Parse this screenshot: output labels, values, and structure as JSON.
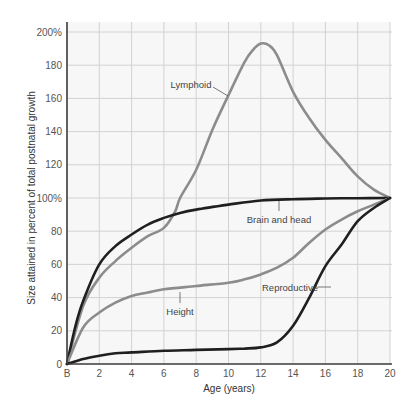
{
  "chart_data": {
    "type": "line",
    "title": "",
    "xlabel": "Age (years)",
    "ylabel": "Size attained in percent of total postnatal growth",
    "xlim": [
      0,
      20
    ],
    "ylim": [
      0,
      200
    ],
    "grid": true,
    "legend": "inline labels",
    "x_tick_labels": [
      "B",
      "2",
      "4",
      "6",
      "8",
      "10",
      "12",
      "14",
      "16",
      "18",
      "20"
    ],
    "y_tick_labels": [
      "0",
      "20",
      "40",
      "60",
      "80",
      "100%",
      "120",
      "140",
      "160",
      "180",
      "200%"
    ],
    "series": [
      {
        "name": "Lymphoid",
        "color": "#8c8c8c",
        "x": [
          0,
          1,
          2,
          3,
          4,
          5,
          6,
          6.7,
          7,
          8,
          9,
          10,
          11,
          11.5,
          12,
          12.5,
          13,
          14,
          15,
          16,
          17,
          18,
          19,
          20
        ],
        "values": [
          0,
          35,
          52,
          62,
          70,
          77,
          82,
          92,
          100,
          117,
          141,
          162,
          182,
          189,
          193,
          192,
          186,
          164,
          148,
          135,
          124,
          113,
          105,
          100
        ]
      },
      {
        "name": "Brain and head",
        "color": "#1f1f1f",
        "x": [
          0,
          0.5,
          1,
          2,
          3,
          4,
          5,
          6,
          7,
          8,
          10,
          12,
          14,
          16,
          18,
          20
        ],
        "values": [
          0,
          22,
          38,
          60,
          71,
          78,
          84,
          88,
          91,
          93,
          96,
          98.5,
          99.3,
          99.7,
          99.9,
          100
        ]
      },
      {
        "name": "Height",
        "color": "#8c8c8c",
        "x": [
          0,
          1,
          2,
          3,
          4,
          5,
          6,
          8,
          10,
          11,
          12,
          13,
          14,
          15,
          16,
          17,
          18,
          19,
          20
        ],
        "values": [
          0,
          22,
          31,
          37,
          41,
          43,
          45,
          47,
          49,
          51,
          54,
          58,
          64,
          73,
          81,
          87,
          92,
          96,
          100
        ]
      },
      {
        "name": "Reproductive",
        "color": "#1f1f1f",
        "x": [
          0,
          1,
          2,
          3,
          4,
          6,
          8,
          10,
          11,
          12,
          13,
          14,
          15,
          16,
          17,
          18,
          19,
          20
        ],
        "values": [
          0,
          3,
          5,
          6.5,
          7,
          8,
          8.5,
          9,
          9.3,
          10,
          13,
          23,
          40,
          59,
          72,
          86,
          94,
          100
        ]
      }
    ],
    "annotations": [
      {
        "text": "Lymphoid",
        "series": "Lymphoid"
      },
      {
        "text": "Brain and head",
        "series": "Brain and head"
      },
      {
        "text": "Height",
        "series": "Height"
      },
      {
        "text": "Reproductive",
        "series": "Reproductive"
      }
    ]
  }
}
